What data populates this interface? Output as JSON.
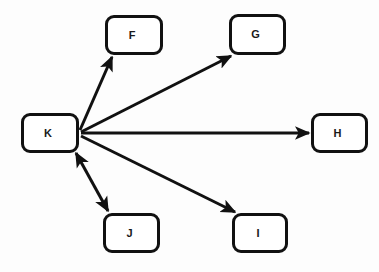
{
  "diagram": {
    "type": "directed-graph",
    "background_color": "#fdfdfd",
    "node_fill_color": "#ffffff",
    "node_border_color": "#111111",
    "edge_color": "#111111",
    "label_color": "#1a1a1a",
    "nodes": [
      {
        "id": "K",
        "label": "K",
        "x": 21,
        "y": 113,
        "w": 58,
        "h": 40
      },
      {
        "id": "F",
        "label": "F",
        "x": 105,
        "y": 15,
        "w": 58,
        "h": 40
      },
      {
        "id": "G",
        "label": "G",
        "x": 229,
        "y": 14,
        "w": 57,
        "h": 41
      },
      {
        "id": "H",
        "label": "H",
        "x": 311,
        "y": 113,
        "w": 57,
        "h": 40
      },
      {
        "id": "I",
        "label": "I",
        "x": 232,
        "y": 213,
        "w": 56,
        "h": 40
      },
      {
        "id": "J",
        "label": "J",
        "x": 103,
        "y": 213,
        "w": 57,
        "h": 40
      }
    ],
    "edges": [
      {
        "from": "K",
        "to": "F",
        "direction": "forward",
        "x1": 80,
        "y1": 130,
        "x2": 112,
        "y2": 57
      },
      {
        "from": "K",
        "to": "G",
        "direction": "forward",
        "x1": 81,
        "y1": 132,
        "x2": 231,
        "y2": 56
      },
      {
        "from": "K",
        "to": "H",
        "direction": "forward",
        "x1": 81,
        "y1": 133,
        "x2": 309,
        "y2": 133
      },
      {
        "from": "K",
        "to": "I",
        "direction": "forward",
        "x1": 81,
        "y1": 136,
        "x2": 235,
        "y2": 212
      },
      {
        "from": "K",
        "to": "J",
        "direction": "bidirectional",
        "x1": 76,
        "y1": 153,
        "x2": 108,
        "y2": 211
      }
    ]
  }
}
